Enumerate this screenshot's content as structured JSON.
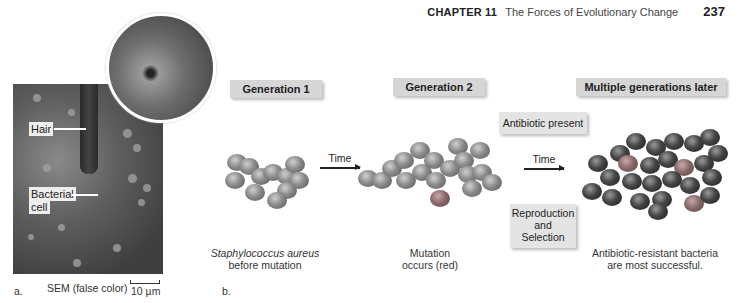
{
  "header": {
    "chapter_label": "CHAPTER 11",
    "chapter_title": "The Forces of Evolutionary Change",
    "page_number": "237"
  },
  "panel_a": {
    "label": "a.",
    "callouts": {
      "hair": "Hair",
      "bacterial_cell_line1": "Bacterial",
      "bacterial_cell_line2": "cell"
    },
    "caption": "SEM (false color)",
    "scale_bar": "10 µm"
  },
  "panel_b": {
    "label": "b.",
    "stages": [
      {
        "title": "Generation 1",
        "caption_line1": "Staphylococcus aureus",
        "caption_line2": "before mutation"
      },
      {
        "title": "Generation 2",
        "caption_line1": "Mutation",
        "caption_line2": "occurs (red)"
      },
      {
        "title": "Multiple generations later",
        "caption_line1": "Antibiotic-resistant bacteria",
        "caption_line2": "are most successful."
      }
    ],
    "arrows": [
      {
        "label": "Time"
      },
      {
        "label": "Time"
      }
    ],
    "condition_box": "Antibiotic present",
    "process_box": {
      "line1": "Reproduction",
      "line2": "and",
      "line3": "Selection"
    }
  }
}
